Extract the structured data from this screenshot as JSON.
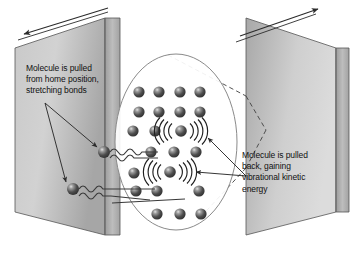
{
  "figure": {
    "background_color": "#ffffff"
  },
  "annotations": {
    "left_caption": "Molecule is pulled\nfrom home position,\nstretching bonds",
    "right_caption": "Molecule is pulled\nback, gaining\nvibrational kinetic\nenergy"
  },
  "plates": {
    "left": {
      "name": "left-plate",
      "fill_top": "#d6d6d6",
      "fill_bottom": "#ababab",
      "edge_fill": "#b4b4b4",
      "stroke": "#4a4a4a",
      "arrow_direction": "left"
    },
    "right": {
      "name": "right-plate",
      "fill_top": "#d9d9d9",
      "fill_bottom": "#a9a9a9",
      "edge_fill": "#b4b4b4",
      "stroke": "#4a4a4a",
      "arrow_direction": "right"
    }
  },
  "magnifier": {
    "shape": "ellipse",
    "cx": 176,
    "cy": 142,
    "rx": 61,
    "ry": 88,
    "stroke": "#8a8a8a",
    "callout_style": "dashed"
  },
  "molecule_style": {
    "fill_dark": "#3c3c3c",
    "fill_mid": "#5a5a5a",
    "highlight": "#d8d8d8",
    "radius": 5.6
  },
  "lattice": {
    "rows": [
      {
        "y": 92,
        "xs": [
          139,
          159,
          180,
          200
        ]
      },
      {
        "y": 112,
        "xs": [
          139,
          159,
          180,
          200
        ]
      },
      {
        "y": 131,
        "xs": [
          133,
          155,
          180
        ]
      },
      {
        "y": 152,
        "xs": [
          151,
          174,
          196
        ]
      },
      {
        "y": 173,
        "xs": [
          134,
          174
        ]
      },
      {
        "y": 191,
        "xs": [
          136,
          157,
          199
        ]
      },
      {
        "y": 214,
        "xs": [
          157,
          180,
          201
        ]
      }
    ]
  },
  "vibrating_molecules": [
    {
      "name": "vibrating-molecule-upper",
      "cx": 181,
      "cy": 131,
      "arcs": 4
    },
    {
      "name": "vibrating-molecule-lower",
      "cx": 170,
      "cy": 172,
      "arcs": 4
    }
  ],
  "bound_molecules": [
    {
      "name": "wall-molecule-upper",
      "cx": 104,
      "cy": 152
    },
    {
      "name": "wall-molecule-lower",
      "cx": 73,
      "cy": 189
    }
  ],
  "arrows": {
    "left_caption_targets": 2,
    "right_caption_targets": 2,
    "plate_motion": 2
  }
}
